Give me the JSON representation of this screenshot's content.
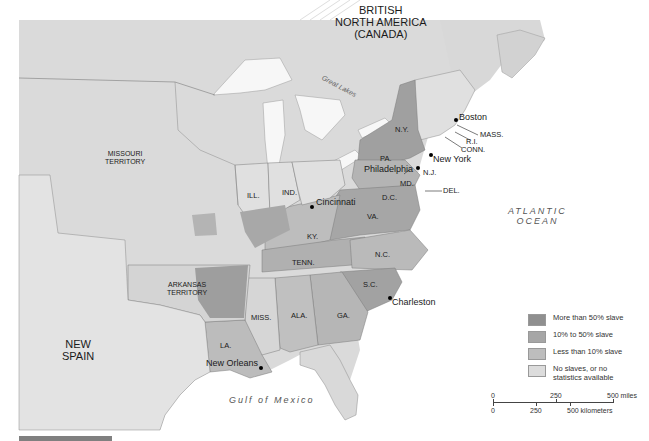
{
  "map": {
    "title": "Slavery in the United States (early 1800s)",
    "regions": {
      "british_north_america": [
        "BRITISH",
        "NORTH AMERICA",
        "(CANADA)"
      ],
      "missouri_territory": [
        "MISSOURI",
        "TERRITORY"
      ],
      "arkansas_territory": [
        "ARKANSAS",
        "TERRITORY"
      ],
      "new_spain": [
        "NEW",
        "SPAIN"
      ]
    },
    "states": {
      "ny": "N.Y.",
      "pa": "PA.",
      "nj": "N.J.",
      "md": "MD.",
      "dc": "D.C.",
      "del": "DEL.",
      "mass": "MASS.",
      "ri": "R.I.",
      "conn": "CONN.",
      "va": "VA.",
      "ky": "KY.",
      "tenn": "TENN.",
      "nc": "N.C.",
      "sc": "S.C.",
      "ga": "GA.",
      "ala": "ALA.",
      "miss": "MISS.",
      "la": "LA.",
      "ill": "ILL.",
      "ind": "IND."
    },
    "cities": {
      "boston": "Boston",
      "new_york": "New York",
      "philadelphia": "Philadelphia",
      "cincinnati": "Cincinnati",
      "charleston": "Charleston",
      "new_orleans": "New Orleans"
    },
    "water": {
      "great_lakes": "Great Lakes",
      "atlantic": [
        "ATLANTIC",
        "OCEAN"
      ],
      "gulf": "Gulf of Mexico"
    }
  },
  "legend": {
    "items": [
      {
        "label": "More than 50% slave",
        "color": "#8f8f8f"
      },
      {
        "label": "10% to 50% slave",
        "color": "#a6a6a6"
      },
      {
        "label": "Less than 10% slave",
        "color": "#bdbdbd"
      },
      {
        "label": "No slaves, or no statistics available",
        "color": "#dcdcdc"
      }
    ]
  },
  "scale": {
    "miles": {
      "zero": "0",
      "mid": "250",
      "end": "500 miles"
    },
    "km": {
      "zero": "0",
      "mid": "250",
      "end": "500 kilometers"
    }
  },
  "colors": {
    "land": "#d9d9d9",
    "land_light": "#e2e2e2",
    "water": "#ffffff",
    "high": "#8f8f8f",
    "mid": "#a6a6a6",
    "low": "#bdbdbd",
    "border": "#7a7a7a"
  }
}
